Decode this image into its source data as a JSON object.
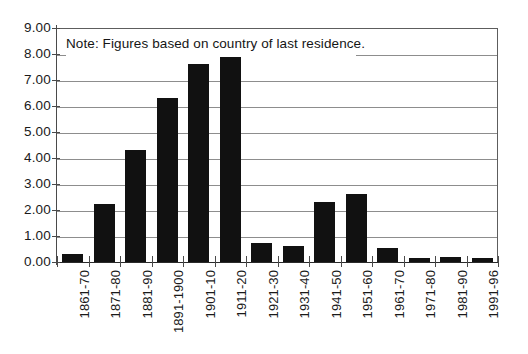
{
  "chart_data": {
    "type": "bar",
    "title": "",
    "subtitle": "",
    "xlabel": "",
    "ylabel": "",
    "ylim": [
      0.0,
      9.0
    ],
    "ytick_step": 1.0,
    "ytick_labels": [
      "9.00",
      "8.00",
      "7.00",
      "6.00",
      "5.00",
      "4.00",
      "3.00",
      "2.00",
      "1.00",
      "0.00"
    ],
    "ytick_values": [
      9.0,
      8.0,
      7.0,
      6.0,
      5.0,
      4.0,
      3.0,
      2.0,
      1.0,
      0.0
    ],
    "grid": true,
    "grid_axis": "y",
    "legend": false,
    "legend_position": "none",
    "bar_color": "#111111",
    "grid_color": "#8d8d8d",
    "axis_color": "#4a4a4a",
    "categories": [
      "1861-70",
      "1871-80",
      "1881-90",
      "1891-1900",
      "1901-10",
      "1911-20",
      "1921-30",
      "1931-40",
      "1941-50",
      "1951-60",
      "1961-70",
      "1971-80",
      "1981-90",
      "1991-96"
    ],
    "values": [
      0.3,
      2.25,
      4.3,
      6.3,
      7.6,
      7.9,
      0.75,
      0.6,
      2.3,
      2.6,
      0.55,
      0.15,
      0.18,
      0.15
    ],
    "annotations": [
      {
        "name": "note",
        "text": "Note: Figures based on country of last residence."
      }
    ]
  },
  "note": {
    "text": "Note: Figures based on country of last residence."
  }
}
